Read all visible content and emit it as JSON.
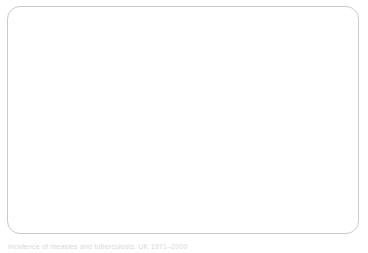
{
  "chart_data": {
    "type": "line",
    "title": "",
    "xlabel": "Year",
    "ylabel": "Number of cases / thousands",
    "xlim": [
      1971,
      2000
    ],
    "ylim": [
      0,
      200
    ],
    "ytick_labels": [
      "0.0",
      "20.0",
      "40.0",
      "60.0",
      "80.0",
      "100.0",
      "120.0",
      "140.0",
      "160.0",
      "180.0",
      "200.0"
    ],
    "ytick_values": [
      0,
      20,
      40,
      60,
      80,
      100,
      120,
      140,
      160,
      180,
      200
    ],
    "xtick_labels": [
      "1971",
      "1974",
      "1977",
      "1980",
      "1983",
      "1986",
      "1989",
      "1992",
      "1995",
      "1998"
    ],
    "xtick_values": [
      1971,
      1974,
      1977,
      1980,
      1983,
      1986,
      1989,
      1992,
      1995,
      1998
    ],
    "x": [
      1971,
      1972,
      1973,
      1974,
      1975,
      1976,
      1977,
      1978,
      1979,
      1980,
      1981,
      1982,
      1983,
      1984,
      1985,
      1986,
      1987,
      1988,
      1989,
      1990,
      1991,
      1992,
      1993,
      1994,
      1995,
      1996,
      1997,
      1998,
      1999,
      2000
    ],
    "grid": true,
    "grid_axis": "y",
    "legend_position": "top-right",
    "series": [
      {
        "name": "Tuberculosis",
        "color": "#808080",
        "values": [
          15.0,
          14.8,
          14.6,
          14.5,
          14.3,
          14.2,
          14.2,
          14.0,
          13.9,
          13.8,
          13.7,
          13.6,
          13.0,
          11.5,
          10.5,
          10.0,
          9.6,
          9.3,
          9.0,
          8.7,
          8.5,
          8.3,
          8.1,
          8.0,
          8.0,
          7.9,
          7.8,
          7.7,
          7.5,
          7.3
        ]
      },
      {
        "name": "Measles",
        "color": "#6e6e6e",
        "values": [
          153.0,
          156.0,
          157.0,
          172.0,
          144.0,
          120.0,
          159.0,
          69.0,
          190.0,
          139.0,
          95.0,
          148.0,
          61.0,
          91.0,
          116.0,
          113.0,
          69.0,
          95.0,
          106.0,
          82.0,
          49.0,
          93.0,
          37.0,
          17.0,
          13.0,
          13.5,
          13.5,
          26.0,
          9.0,
          7.5
        ]
      }
    ]
  },
  "legend": {
    "items": [
      {
        "label": "Tuberculosis"
      },
      {
        "label": "Measles"
      }
    ]
  },
  "caption": {
    "text": "Incidence of measles and tuberculosis, UK 1971–2000"
  }
}
